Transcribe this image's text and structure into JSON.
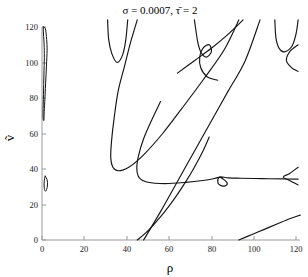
{
  "chart_data": {
    "type": "line",
    "title": "σ = 0.0007, τ̄ = 2",
    "title_parts": {
      "sigma_symbol": "σ",
      "sigma_value": "0.0007",
      "tau_symbol": "τ̄",
      "tau_value": "2"
    },
    "xlabel": "ρ",
    "ylabel": "ṽ",
    "xlim": [
      0,
      125
    ],
    "ylim": [
      0,
      125
    ],
    "xticks": [
      0,
      20,
      40,
      60,
      80,
      100,
      120
    ],
    "xticklabels": [
      "0",
      "20",
      "40",
      "60",
      "80",
      "100",
      "120"
    ],
    "yticks": [
      0,
      20,
      40,
      60,
      80,
      100,
      120
    ],
    "yticklabels": [
      "0",
      "20",
      "40",
      "60",
      "80",
      "100",
      "120"
    ],
    "grid": false,
    "legend": false,
    "line_color": "#141414",
    "axis_color": "#9a9a9a",
    "background": "#ffffff",
    "series": [
      {
        "name": "thin-loop-upper",
        "comment": "narrow closed sliver near rho=0 from v=67 to v=120",
        "points": [
          [
            0.6,
            120
          ],
          [
            1.6,
            119
          ],
          [
            2.2,
            113
          ],
          [
            2.4,
            107
          ],
          [
            2.1,
            98
          ],
          [
            1.7,
            88
          ],
          [
            1.3,
            78
          ],
          [
            1.0,
            71
          ],
          [
            0.9,
            67.5
          ],
          [
            0.6,
            68
          ],
          [
            0.5,
            72
          ],
          [
            0.7,
            82
          ],
          [
            0.9,
            93
          ],
          [
            1.1,
            103
          ],
          [
            1.0,
            110
          ],
          [
            0.7,
            116
          ],
          [
            0.6,
            120
          ]
        ]
      },
      {
        "name": "thin-loop-lower",
        "comment": "small closed loop near rho=1, v=28 to 36",
        "points": [
          [
            1.5,
            36
          ],
          [
            2.4,
            34
          ],
          [
            2.6,
            31
          ],
          [
            2.2,
            28.5
          ],
          [
            1.6,
            27.5
          ],
          [
            1.1,
            29
          ],
          [
            1.0,
            32
          ],
          [
            1.2,
            34.5
          ],
          [
            1.5,
            36
          ]
        ]
      },
      {
        "name": "branch-A-cusp-upper-left",
        "comment": "small V cusp near rho 31-40, top of frame",
        "points": [
          [
            31,
            124
          ],
          [
            31.5,
            113
          ],
          [
            33,
            105
          ],
          [
            35.5,
            100
          ],
          [
            38,
            104
          ],
          [
            39.5,
            112
          ],
          [
            40.5,
            124
          ]
        ]
      },
      {
        "name": "branch-B-long-V",
        "comment": "large V from top-left down to vertex near rho 33, v=40 and back up right",
        "points": [
          [
            45,
            124
          ],
          [
            42,
            112
          ],
          [
            39,
            98
          ],
          [
            36,
            84
          ],
          [
            34,
            68
          ],
          [
            32.8,
            55
          ],
          [
            32.5,
            46
          ],
          [
            33.5,
            41
          ],
          [
            36,
            39
          ],
          [
            41,
            41
          ],
          [
            48,
            48
          ],
          [
            57,
            60
          ],
          [
            66,
            74
          ],
          [
            76,
            90
          ],
          [
            86,
            107
          ],
          [
            93,
            124
          ]
        ]
      },
      {
        "name": "branch-C-rising-right",
        "comment": "steep line from lower-middle to upper-right",
        "points": [
          [
            48,
            0
          ],
          [
            56,
            16
          ],
          [
            64,
            33
          ],
          [
            72,
            50
          ],
          [
            80,
            67
          ],
          [
            88,
            84
          ],
          [
            96,
            101
          ],
          [
            103,
            124
          ]
        ]
      },
      {
        "name": "branch-D-cusp-top-right-loop",
        "comment": "small crossing loop near rho 77, v=104",
        "points": [
          [
            72,
            124
          ],
          [
            73.5,
            112
          ],
          [
            75,
            106
          ],
          [
            77.5,
            103
          ],
          [
            80,
            106
          ],
          [
            79,
            110
          ],
          [
            76,
            108
          ],
          [
            74.5,
            103
          ],
          [
            75,
            97
          ],
          [
            78,
            92
          ],
          [
            83,
            90
          ]
        ]
      },
      {
        "name": "branch-E-upper-right-diag",
        "comment": "diagonal from near rho 68 upward right",
        "points": [
          [
            64,
            94
          ],
          [
            72,
            101
          ],
          [
            80,
            108
          ],
          [
            88,
            116
          ],
          [
            95,
            124
          ]
        ]
      },
      {
        "name": "branch-F-top-right-V",
        "comment": "small V cusp near rho 110-120 at top",
        "points": [
          [
            110,
            124
          ],
          [
            110.5,
            114
          ],
          [
            112,
            108
          ],
          [
            114.5,
            106
          ],
          [
            118,
            109
          ],
          [
            120,
            116
          ],
          [
            121,
            124
          ]
        ]
      },
      {
        "name": "branch-G-middle-U",
        "comment": "long shallow U from upper-left through vertex near rho 47 v=32 to the right",
        "points": [
          [
            56,
            78
          ],
          [
            52,
            68
          ],
          [
            48,
            57
          ],
          [
            45.5,
            47
          ],
          [
            44.8,
            40
          ],
          [
            46,
            35
          ],
          [
            50,
            32.5
          ],
          [
            58,
            31.8
          ],
          [
            68,
            32.5
          ],
          [
            76,
            33.5
          ],
          [
            81,
            34.5
          ],
          [
            84,
            35.5
          ]
        ]
      },
      {
        "name": "branch-H-small-loop-center",
        "comment": "small loop at rho 82, v=35 where branches meet",
        "points": [
          [
            84,
            35.5
          ],
          [
            86,
            34
          ],
          [
            87.5,
            32
          ],
          [
            86.5,
            30.5
          ],
          [
            84,
            31
          ],
          [
            83,
            33
          ],
          [
            84,
            35.5
          ],
          [
            88,
            35
          ],
          [
            94,
            34.8
          ],
          [
            104,
            34.6
          ],
          [
            114,
            34.4
          ],
          [
            121,
            34.3
          ]
        ]
      },
      {
        "name": "branch-I-lower-rising-1",
        "comment": "curve rising from rho axis at 45",
        "points": [
          [
            45,
            0
          ],
          [
            49,
            4
          ],
          [
            53,
            9
          ],
          [
            58,
            16
          ],
          [
            63,
            24
          ],
          [
            68,
            33
          ],
          [
            72,
            41
          ],
          [
            76,
            50
          ],
          [
            79,
            58
          ]
        ]
      },
      {
        "name": "branch-J-lower-rising-2",
        "comment": "nearly straight line rising from rho axis at 93",
        "points": [
          [
            93,
            0
          ],
          [
            99,
            3
          ],
          [
            105,
            6
          ],
          [
            111,
            9
          ],
          [
            117,
            12
          ],
          [
            122,
            14
          ]
        ]
      },
      {
        "name": "branch-K-right-fork",
        "comment": "fork / cusp opening leftwards near rho 118, v=36",
        "points": [
          [
            121,
            41
          ],
          [
            117,
            37.5
          ],
          [
            114,
            35.5
          ],
          [
            117,
            33.5
          ],
          [
            121,
            31
          ]
        ]
      },
      {
        "name": "branch-L-right-small-cusp-top",
        "comment": "small cusp near rho 118, v=103",
        "points": [
          [
            121,
            110
          ],
          [
            117,
            106
          ],
          [
            115.5,
            101
          ],
          [
            118,
            97
          ],
          [
            121,
            95
          ]
        ]
      }
    ]
  }
}
